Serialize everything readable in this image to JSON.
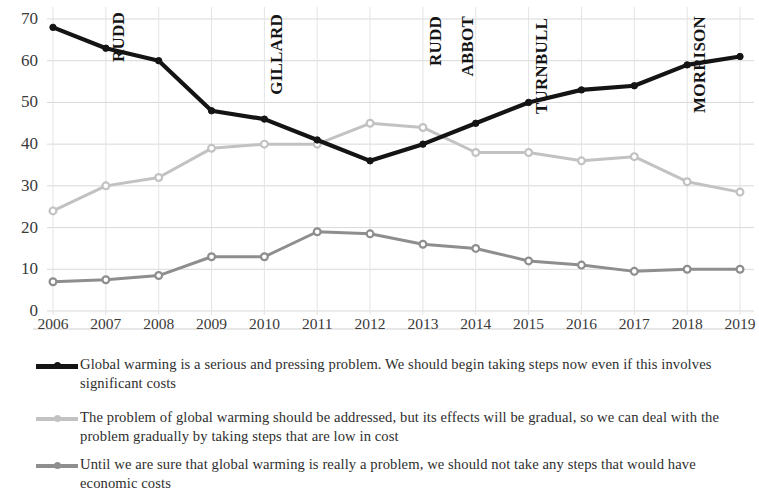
{
  "chart_data": {
    "type": "line",
    "title": "",
    "subtitle": "",
    "xlabel": "",
    "ylabel": "",
    "x": [
      2006,
      2007,
      2008,
      2009,
      2010,
      2011,
      2012,
      2013,
      2014,
      2015,
      2016,
      2017,
      2018,
      2019
    ],
    "categories": [
      "2006",
      "2007",
      "2008",
      "2009",
      "2010",
      "2011",
      "2012",
      "2013",
      "2014",
      "2015",
      "2016",
      "2017",
      "2018",
      "2019"
    ],
    "ylim": [
      0,
      70
    ],
    "yticks": [
      0,
      10,
      20,
      30,
      40,
      50,
      60,
      70
    ],
    "ytick_labels": [
      "0",
      "10",
      "20",
      "30",
      "40",
      "50",
      "60",
      "70"
    ],
    "grid": true,
    "legend_position": "below",
    "series": [
      {
        "name": "Global warming is a serious and pressing problem. We should begin taking steps now even if this involves significant costs",
        "color": "#141414",
        "values": [
          68,
          63,
          60,
          48,
          46,
          41,
          36,
          40,
          45,
          50,
          53,
          54,
          59,
          61
        ]
      },
      {
        "name": "The problem of global warming should be addressed, but its effects will be gradual, so we can deal with the problem gradually by taking steps that are low in cost",
        "color": "#c2c2c2",
        "values": [
          24,
          30,
          32,
          39,
          40,
          40,
          45,
          44,
          38,
          38,
          36,
          37,
          31,
          28.5
        ]
      },
      {
        "name": "Until we are sure that global warming is really a problem, we should not take any steps that would have economic costs",
        "color": "#8e8e8e",
        "values": [
          7,
          7.5,
          8.5,
          13,
          13,
          19,
          18.5,
          16,
          15,
          12,
          11,
          9.5,
          10,
          10
        ]
      }
    ],
    "annotations": [
      {
        "text": "RUDD",
        "x": 2007,
        "note": "prime minister term marker"
      },
      {
        "text": "GILLARD",
        "x": 2010,
        "note": "prime minister term marker"
      },
      {
        "text": "RUDD",
        "x": 2013,
        "note": "prime minister term marker"
      },
      {
        "text": "ABBOT",
        "x": 2013.6,
        "note": "prime minister term marker"
      },
      {
        "text": "TURNBULL",
        "x": 2015,
        "note": "prime minister term marker"
      },
      {
        "text": "MORRISON",
        "x": 2018,
        "note": "prime minister term marker"
      }
    ]
  },
  "legend": {
    "items": [
      {
        "label": "Global warming is a serious and pressing problem. We should begin taking steps now even if this involves significant costs",
        "color": "#141414"
      },
      {
        "label": "The problem of global warming should be addressed, but its effects will be gradual, so we can deal with the problem gradually by taking steps that are low in cost",
        "color": "#c2c2c2"
      },
      {
        "label": "Until we are sure that global warming is really a problem, we should not take any steps that would have economic costs",
        "color": "#8e8e8e"
      }
    ]
  }
}
